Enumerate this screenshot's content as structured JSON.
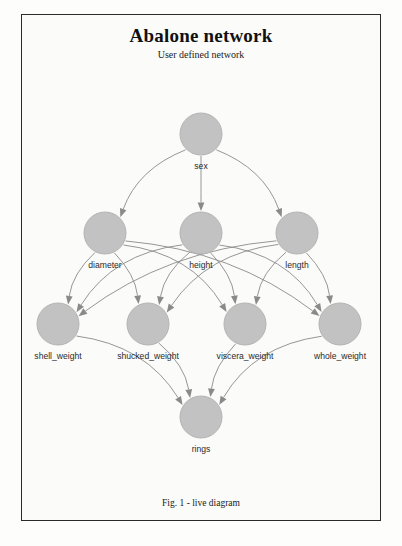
{
  "document": {
    "title": "Abalone network",
    "subtitle": "User defined network",
    "caption": "Fig. 1 - live diagram"
  },
  "colors": {
    "node_fill": "#c2c2c2",
    "node_stroke": "#b4b4b4",
    "edge": "#8a8a8a",
    "frame": "#2b2b2b",
    "page_bg": "#fbfbf9",
    "text": "#1a1a1a"
  },
  "chart_data": {
    "type": "diagram",
    "diagram_kind": "bayesian-network-dag",
    "title": "Abalone network",
    "subtitle": "User defined network",
    "caption": "Fig. 1 - live diagram",
    "nodes": [
      {
        "id": "sex",
        "label": "sex",
        "x": 201,
        "y": 134,
        "r": 21,
        "layer": 0
      },
      {
        "id": "diameter",
        "label": "diameter",
        "x": 105,
        "y": 233,
        "r": 21,
        "layer": 1
      },
      {
        "id": "height",
        "label": "height",
        "x": 201,
        "y": 233,
        "r": 21,
        "layer": 1
      },
      {
        "id": "length",
        "label": "length",
        "x": 297,
        "y": 233,
        "r": 21,
        "layer": 1
      },
      {
        "id": "shell_weight",
        "label": "shell_weight",
        "x": 58,
        "y": 324,
        "r": 21,
        "layer": 2
      },
      {
        "id": "shucked_weight",
        "label": "shucked_weight",
        "x": 148,
        "y": 324,
        "r": 21,
        "layer": 2
      },
      {
        "id": "viscera_weight",
        "label": "viscera_weight",
        "x": 245,
        "y": 324,
        "r": 21,
        "layer": 2
      },
      {
        "id": "whole_weight",
        "label": "whole_weight",
        "x": 340,
        "y": 324,
        "r": 21,
        "layer": 2
      },
      {
        "id": "rings",
        "label": "rings",
        "x": 201,
        "y": 417,
        "r": 21,
        "layer": 3
      }
    ],
    "edges": [
      {
        "from": "sex",
        "to": "diameter"
      },
      {
        "from": "sex",
        "to": "height"
      },
      {
        "from": "sex",
        "to": "length"
      },
      {
        "from": "diameter",
        "to": "shell_weight"
      },
      {
        "from": "diameter",
        "to": "shucked_weight"
      },
      {
        "from": "diameter",
        "to": "viscera_weight"
      },
      {
        "from": "diameter",
        "to": "whole_weight"
      },
      {
        "from": "height",
        "to": "shell_weight"
      },
      {
        "from": "height",
        "to": "shucked_weight"
      },
      {
        "from": "height",
        "to": "viscera_weight"
      },
      {
        "from": "height",
        "to": "whole_weight"
      },
      {
        "from": "length",
        "to": "shell_weight"
      },
      {
        "from": "length",
        "to": "shucked_weight"
      },
      {
        "from": "length",
        "to": "viscera_weight"
      },
      {
        "from": "length",
        "to": "whole_weight"
      },
      {
        "from": "shell_weight",
        "to": "rings"
      },
      {
        "from": "shucked_weight",
        "to": "rings"
      },
      {
        "from": "viscera_weight",
        "to": "rings"
      },
      {
        "from": "whole_weight",
        "to": "rings"
      }
    ],
    "node_count": 9,
    "edge_count": 19,
    "directed": true
  }
}
